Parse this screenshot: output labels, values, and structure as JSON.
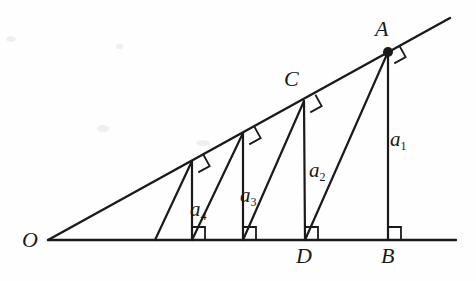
{
  "figure": {
    "type": "geometry-diagram",
    "stroke_color": "#1a1a1a",
    "background_color": "#fefefe",
    "points": [
      {
        "name": "O",
        "label": "O",
        "x": 48,
        "y": 240,
        "label_x": 22,
        "label_y": 229,
        "marker": "none"
      },
      {
        "name": "A",
        "label": "A",
        "x": 388,
        "y": 52,
        "label_x": 375,
        "label_y": 18,
        "marker": "dot"
      },
      {
        "name": "C",
        "label": "C",
        "x": 304,
        "y": 101,
        "label_x": 284,
        "label_y": 68,
        "marker": "none"
      },
      {
        "name": "D",
        "label": "D",
        "x": 305,
        "y": 240,
        "label_x": 296,
        "label_y": 245,
        "marker": "none"
      },
      {
        "name": "B",
        "label": "B",
        "x": 388,
        "y": 240,
        "label_x": 381,
        "label_y": 245,
        "marker": "none"
      }
    ],
    "segment_labels": [
      {
        "name": "a1",
        "base": "a",
        "sub": "1",
        "x": 390,
        "y": 129
      },
      {
        "name": "a2",
        "base": "a",
        "sub": "2",
        "x": 309,
        "y": 160
      },
      {
        "name": "a3",
        "base": "a",
        "sub": "3",
        "x": 240,
        "y": 185
      },
      {
        "name": "a4",
        "base": "a",
        "sub": "4",
        "x": 190,
        "y": 199
      }
    ],
    "rays": [
      {
        "name": "baseline",
        "x1": 48,
        "y1": 240,
        "x2": 456,
        "y2": 240
      },
      {
        "name": "inclined-ray",
        "x1": 48,
        "y1": 240,
        "x2": 450,
        "y2": 18
      }
    ],
    "verticals": [
      {
        "name": "altitude-a1-AB",
        "x1": 388,
        "y1": 52,
        "x2": 388,
        "y2": 240
      },
      {
        "name": "altitude-a2-CD",
        "x1": 304,
        "y1": 101,
        "x2": 305,
        "y2": 240
      },
      {
        "name": "altitude-a3",
        "x1": 243,
        "y1": 133,
        "x2": 243,
        "y2": 240
      },
      {
        "name": "altitude-a4",
        "x1": 192,
        "y1": 161,
        "x2": 192,
        "y2": 240
      }
    ],
    "hypotenuses": [
      {
        "name": "hyp-A-to-D",
        "x1": 388,
        "y1": 52,
        "x2": 305,
        "y2": 240
      },
      {
        "name": "hyp-C-to-foot3",
        "x1": 304,
        "y1": 101,
        "x2": 243,
        "y2": 240
      },
      {
        "name": "hyp-p3-to-foot4",
        "x1": 243,
        "y1": 133,
        "x2": 192,
        "y2": 240
      },
      {
        "name": "hyp-p4-to-base",
        "x1": 192,
        "y1": 161,
        "x2": 155,
        "y2": 240
      }
    ],
    "right_angles_on_ray": [
      {
        "name": "right-angle-at-A-ray",
        "x": 388,
        "y": 52
      },
      {
        "name": "right-angle-at-C-ray",
        "x": 304,
        "y": 101
      },
      {
        "name": "right-angle-at-p3-ray",
        "x": 243,
        "y": 133
      },
      {
        "name": "right-angle-at-p4-ray",
        "x": 192,
        "y": 161
      }
    ],
    "right_angles_on_base": [
      {
        "name": "right-angle-at-B-base",
        "x": 388,
        "y": 240
      },
      {
        "name": "right-angle-at-D-base",
        "x": 305,
        "y": 240
      },
      {
        "name": "right-angle-at-foot3-base",
        "x": 243,
        "y": 240
      },
      {
        "name": "right-angle-at-foot4-base",
        "x": 192,
        "y": 240
      }
    ]
  }
}
